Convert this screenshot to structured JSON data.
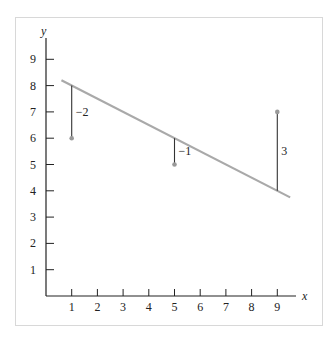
{
  "chart_data": {
    "type": "scatter",
    "title": "",
    "xlabel": "x",
    "ylabel": "y",
    "xlim": [
      0,
      9.8
    ],
    "ylim": [
      0,
      10
    ],
    "x_ticks": [
      1,
      2,
      3,
      4,
      5,
      6,
      7,
      8,
      9
    ],
    "y_ticks": [
      1,
      2,
      3,
      4,
      5,
      6,
      7,
      8,
      9
    ],
    "grid": false,
    "legend": null,
    "points": [
      {
        "x": 1,
        "y": 6
      },
      {
        "x": 5,
        "y": 5
      },
      {
        "x": 9,
        "y": 7
      }
    ],
    "fit_line": {
      "slope": -0.5,
      "intercept": 8.5,
      "x_start": 0.6,
      "x_end": 9.5
    },
    "residuals": [
      {
        "x": 1,
        "y_point": 6,
        "y_line": 8,
        "label": "−2"
      },
      {
        "x": 5,
        "y_point": 5,
        "y_line": 6,
        "label": "−1"
      },
      {
        "x": 9,
        "y_point": 7,
        "y_line": 4,
        "label": "3"
      }
    ],
    "colors": {
      "axis": "#222222",
      "fit_line": "#a9a9a9",
      "points": "#9a9a9a",
      "residual_segment": "#333333",
      "frame": "#d8d8d8"
    }
  }
}
